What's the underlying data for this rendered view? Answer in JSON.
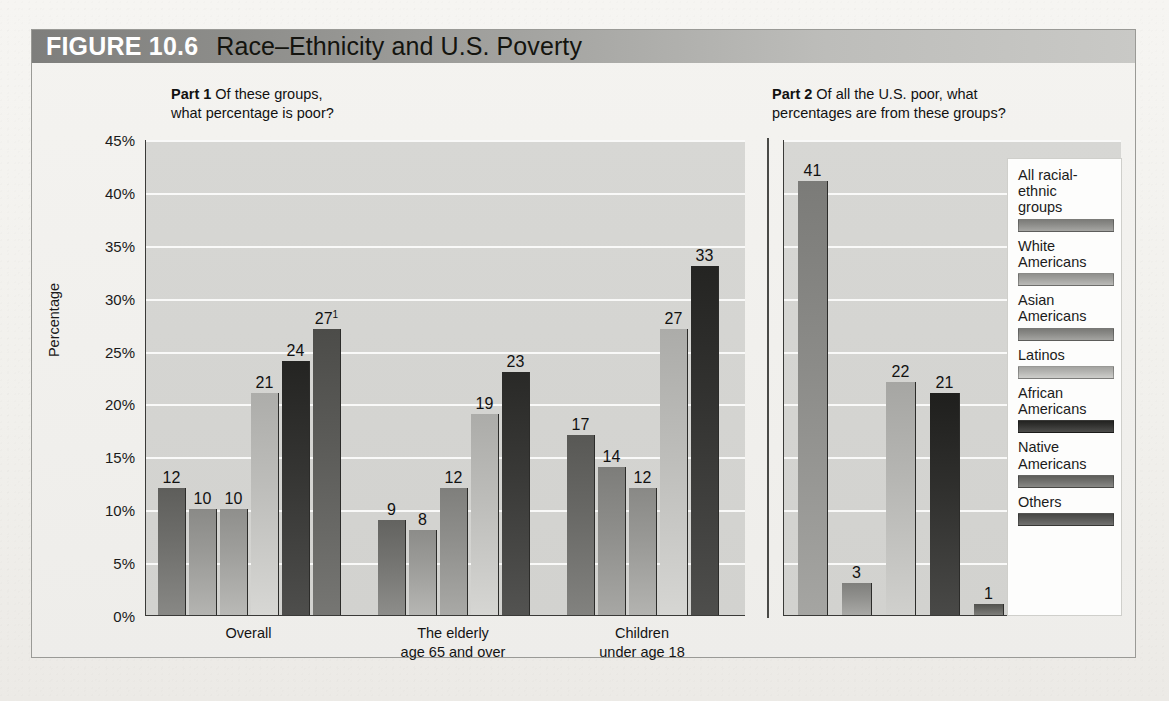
{
  "figure": {
    "number_label": "FIGURE 10.6",
    "title": "Race–Ethnicity and U.S. Poverty"
  },
  "part1": {
    "label": "Part 1",
    "question_line1": "Of these groups,",
    "question_line2": "what percentage is poor?"
  },
  "part2": {
    "label": "Part 2",
    "question_line1": "Of all the U.S. poor, what",
    "question_line2": "percentages are from these groups?"
  },
  "legend": {
    "items": [
      {
        "label": "All racial-\nethnic\ngroups",
        "color": "#8c8c89"
      },
      {
        "label": "White\nAmericans",
        "color": "#a0a09d"
      },
      {
        "label": "Asian\nAmericans",
        "color": "#8a8a87"
      },
      {
        "label": "Latinos",
        "color": "#b4b4b1"
      },
      {
        "label": "African\nAmericans",
        "color": "#333331"
      },
      {
        "label": "Native\nAmericans",
        "color": "#6e6e6b"
      },
      {
        "label": "Others",
        "color": "#575755"
      }
    ]
  },
  "chart_data": [
    {
      "type": "bar",
      "title": "Part 1 Of these groups, what percentage is poor?",
      "xlabel": "",
      "ylabel": "Percentage",
      "ylim": [
        0,
        45
      ],
      "yticks": [
        "0%",
        "5%",
        "10%",
        "15%",
        "20%",
        "25%",
        "30%",
        "35%",
        "40%",
        "45%"
      ],
      "grid": true,
      "legend_position": "right",
      "categories": [
        "Overall",
        "The elderly\nage 65 and over",
        "Children\nunder age 18"
      ],
      "groups": [
        {
          "category": "Overall",
          "label_line1": "Overall",
          "label_line2": "",
          "bars": [
            {
              "series": "All racial-ethnic groups",
              "value": 12,
              "label": "12",
              "sup": "",
              "color": "#6e6e6b"
            },
            {
              "series": "White Americans",
              "value": 10,
              "label": "10",
              "sup": "",
              "color": "#9a9a97"
            },
            {
              "series": "Asian Americans",
              "value": 10,
              "label": "10",
              "sup": "",
              "color": "#9f9f9c"
            },
            {
              "series": "Latinos",
              "value": 21,
              "label": "21",
              "sup": "",
              "color": "#bdbdba"
            },
            {
              "series": "African Americans",
              "value": 24,
              "label": "24",
              "sup": "",
              "color": "#343432"
            },
            {
              "series": "Native Americans",
              "value": 27,
              "label": "27",
              "sup": "1",
              "color": "#5c5c59"
            }
          ]
        },
        {
          "category": "The elderly age 65 and over",
          "label_line1": "The elderly",
          "label_line2": "age 65 and over",
          "bars": [
            {
              "series": "All racial-ethnic groups",
              "value": 9,
              "label": "9",
              "sup": "",
              "color": "#737370"
            },
            {
              "series": "White Americans",
              "value": 8,
              "label": "8",
              "sup": "",
              "color": "#9c9c99"
            },
            {
              "series": "Asian Americans",
              "value": 12,
              "label": "12",
              "sup": "",
              "color": "#8f8f8c"
            },
            {
              "series": "Latinos",
              "value": 19,
              "label": "19",
              "sup": "",
              "color": "#bcbcb9"
            },
            {
              "series": "African Americans",
              "value": 23,
              "label": "23",
              "sup": "",
              "color": "#393937"
            }
          ]
        },
        {
          "category": "Children under age 18",
          "label_line1": "Children",
          "label_line2": "under age 18",
          "bars": [
            {
              "series": "All racial-ethnic groups",
              "value": 17,
              "label": "17",
              "sup": "",
              "color": "#686865"
            },
            {
              "series": "White Americans",
              "value": 14,
              "label": "14",
              "sup": "",
              "color": "#8d8d8a"
            },
            {
              "series": "Asian Americans",
              "value": 12,
              "label": "12",
              "sup": "",
              "color": "#999996"
            },
            {
              "series": "Latinos",
              "value": 27,
              "label": "27",
              "sup": "",
              "color": "#bcbcb9"
            },
            {
              "series": "African Americans",
              "value": 33,
              "label": "33",
              "sup": "",
              "color": "#343432"
            }
          ]
        }
      ]
    },
    {
      "type": "bar",
      "title": "Part 2 Of all the U.S. poor, what percentages are from these groups?",
      "xlabel": "",
      "ylabel": "",
      "ylim": [
        0,
        45
      ],
      "grid": true,
      "legend_position": "right",
      "categories": [
        "White Americans",
        "Asian Americans",
        "Latinos",
        "African Americans",
        "Native Americans",
        "Others"
      ],
      "values": [
        41,
        3,
        22,
        21,
        1,
        12
      ],
      "bars": [
        {
          "series": "White Americans",
          "value": 41,
          "label": "41",
          "sup": "",
          "color": "#8b8b88"
        },
        {
          "series": "Asian Americans",
          "value": 3,
          "label": "3",
          "sup": "",
          "color": "#8f8f8c"
        },
        {
          "series": "Latinos",
          "value": 22,
          "label": "22",
          "sup": "",
          "color": "#b6b6b3"
        },
        {
          "series": "African Americans",
          "value": 21,
          "label": "21",
          "sup": "",
          "color": "#2f2f2d"
        },
        {
          "series": "Native Americans",
          "value": 1,
          "label": "1",
          "sup": "",
          "color": "#63635f"
        },
        {
          "series": "Others",
          "value": 12,
          "label": "12",
          "sup": "2",
          "color": "#5a5a57"
        }
      ]
    }
  ]
}
